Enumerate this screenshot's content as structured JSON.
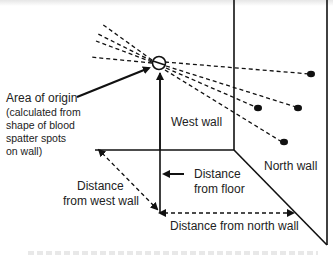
{
  "diagram": {
    "labels": {
      "area_of_origin": "Area of origin",
      "area_note_1": "(calculated from",
      "area_note_2": "shape of blood",
      "area_note_3": "spatter spots",
      "area_note_4": "on wall)",
      "west_wall": "West wall",
      "north_wall": "North wall",
      "distance_from_floor_1": "Distance",
      "distance_from_floor_2": "from floor",
      "distance_from_west_wall_1": "Distance",
      "distance_from_west_wall_2": "from west wall",
      "distance_from_north_wall": "Distance from north wall"
    },
    "elements": {
      "origin_marker": "circle-with-slash",
      "spatter_spots_count": 4,
      "trajectory_lines": "dashed"
    },
    "colors": {
      "line": "#111111",
      "text": "#222222",
      "background": "#ffffff"
    }
  }
}
